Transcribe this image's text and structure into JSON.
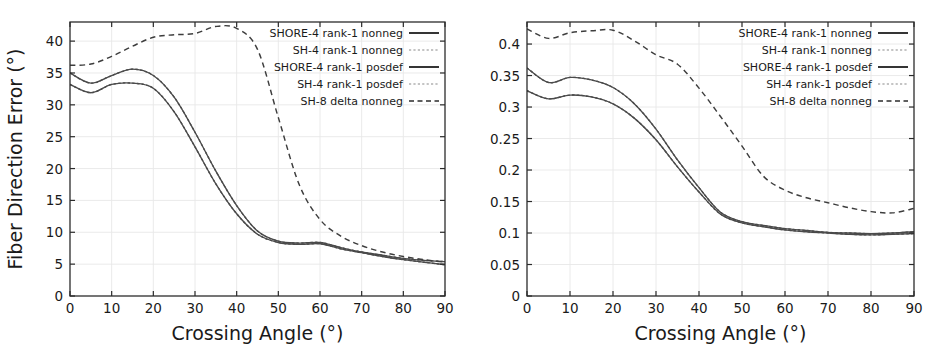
{
  "figure": {
    "panel_count": 2
  },
  "chart_data": [
    {
      "type": "line",
      "title": "",
      "xlabel": "Crossing Angle (°)",
      "ylabel": "Fiber Direction Error (°)",
      "xlim": [
        0,
        90
      ],
      "ylim": [
        0,
        43
      ],
      "xticks": [
        0,
        10,
        20,
        30,
        40,
        50,
        60,
        70,
        80,
        90
      ],
      "xticklabels": [
        "0",
        "10",
        "20",
        "30",
        "40",
        "50",
        "60",
        "70",
        "80",
        "90"
      ],
      "yticks": [
        0,
        5,
        10,
        15,
        20,
        25,
        30,
        35,
        40
      ],
      "yticklabels": [
        "0",
        "5",
        "10",
        "15",
        "20",
        "25",
        "30",
        "35",
        "40"
      ],
      "grid": true,
      "legend_position": "upper right",
      "x": [
        0,
        5,
        10,
        15,
        20,
        25,
        30,
        35,
        40,
        45,
        50,
        55,
        60,
        65,
        70,
        75,
        80,
        85,
        90
      ],
      "series": [
        {
          "name": "SHORE-4 rank-1 nonneg",
          "style": "solid",
          "values": [
            35.0,
            33.4,
            34.6,
            35.6,
            34.6,
            31.2,
            25.7,
            19.6,
            14.2,
            10.2,
            8.6,
            8.3,
            8.4,
            7.6,
            6.9,
            6.4,
            5.9,
            5.6,
            5.4
          ]
        },
        {
          "name": "SH-4 rank-1 nonneg",
          "style": "dashed-fine",
          "values": [
            35.0,
            33.4,
            34.6,
            35.6,
            34.6,
            31.2,
            25.7,
            19.6,
            14.2,
            10.2,
            8.6,
            8.3,
            8.4,
            7.6,
            6.9,
            6.4,
            5.9,
            5.6,
            5.4
          ]
        },
        {
          "name": "SHORE-4 rank-1 posdef",
          "style": "solid",
          "values": [
            33.2,
            31.9,
            33.2,
            33.4,
            32.6,
            28.9,
            23.4,
            17.6,
            12.9,
            9.7,
            8.4,
            8.1,
            8.2,
            7.4,
            6.8,
            6.2,
            5.7,
            5.3,
            4.9
          ]
        },
        {
          "name": "SH-4 rank-1 posdef",
          "style": "dashed-fine",
          "values": [
            33.2,
            31.9,
            33.2,
            33.4,
            32.6,
            28.9,
            23.4,
            17.6,
            12.9,
            9.7,
            8.4,
            8.1,
            8.2,
            7.4,
            6.8,
            6.2,
            5.7,
            5.3,
            4.9
          ]
        },
        {
          "name": "SH-8 delta nonneg",
          "style": "dashed-big",
          "values": [
            36.2,
            36.4,
            37.6,
            39.2,
            40.6,
            41.0,
            41.2,
            42.3,
            42.0,
            38.7,
            28.0,
            17.5,
            12.0,
            9.4,
            7.9,
            6.9,
            6.2,
            5.7,
            5.3
          ]
        }
      ]
    },
    {
      "type": "line",
      "title": "",
      "xlabel": "Crossing Angle (°)",
      "ylabel": "Volume Fraction Error",
      "xlim": [
        0,
        90
      ],
      "ylim": [
        0,
        0.435
      ],
      "xticks": [
        0,
        10,
        20,
        30,
        40,
        50,
        60,
        70,
        80,
        90
      ],
      "xticklabels": [
        "0",
        "10",
        "20",
        "30",
        "40",
        "50",
        "60",
        "70",
        "80",
        "90"
      ],
      "yticks": [
        0,
        0.05,
        0.1,
        0.15,
        0.2,
        0.25,
        0.3,
        0.35,
        0.4
      ],
      "yticklabels": [
        "0",
        "0.05",
        "0.1",
        "0.15",
        "0.2",
        "0.25",
        "0.3",
        "0.35",
        "0.4"
      ],
      "grid": true,
      "legend_position": "upper right",
      "x": [
        0,
        5,
        10,
        15,
        20,
        25,
        30,
        35,
        40,
        45,
        50,
        55,
        60,
        65,
        70,
        75,
        80,
        85,
        90
      ],
      "series": [
        {
          "name": "SHORE-4 rank-1 nonneg",
          "style": "solid",
          "values": [
            0.362,
            0.339,
            0.347,
            0.343,
            0.331,
            0.305,
            0.265,
            0.216,
            0.172,
            0.133,
            0.118,
            0.112,
            0.107,
            0.104,
            0.101,
            0.1,
            0.099,
            0.1,
            0.102
          ]
        },
        {
          "name": "SH-4 rank-1 nonneg",
          "style": "dashed-fine",
          "values": [
            0.362,
            0.339,
            0.347,
            0.343,
            0.331,
            0.305,
            0.265,
            0.216,
            0.172,
            0.133,
            0.118,
            0.112,
            0.107,
            0.104,
            0.101,
            0.1,
            0.099,
            0.1,
            0.102
          ]
        },
        {
          "name": "SHORE-4 rank-1 posdef",
          "style": "solid",
          "values": [
            0.326,
            0.313,
            0.319,
            0.316,
            0.305,
            0.282,
            0.248,
            0.205,
            0.165,
            0.13,
            0.116,
            0.11,
            0.105,
            0.102,
            0.1,
            0.098,
            0.097,
            0.098,
            0.099
          ]
        },
        {
          "name": "SH-4 rank-1 posdef",
          "style": "dashed-fine",
          "values": [
            0.326,
            0.313,
            0.319,
            0.316,
            0.305,
            0.282,
            0.248,
            0.205,
            0.165,
            0.13,
            0.116,
            0.11,
            0.105,
            0.102,
            0.1,
            0.098,
            0.097,
            0.098,
            0.099
          ]
        },
        {
          "name": "SH-8 delta nonneg",
          "style": "dashed-big",
          "values": [
            0.424,
            0.409,
            0.418,
            0.421,
            0.422,
            0.405,
            0.383,
            0.368,
            0.33,
            0.285,
            0.238,
            0.19,
            0.168,
            0.156,
            0.148,
            0.14,
            0.134,
            0.132,
            0.139
          ]
        }
      ]
    }
  ]
}
